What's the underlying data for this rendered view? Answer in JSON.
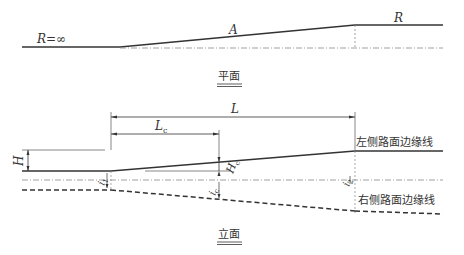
{
  "plan_view": {
    "caption": "平面",
    "label_left": "R=∞",
    "label_middle": "A",
    "label_right": "R"
  },
  "elevation_view": {
    "caption": "立面",
    "dim_L": "L",
    "dim_Lc": "L",
    "dim_Lc_sub": "c",
    "dim_H": "H",
    "dim_Hc": "H",
    "dim_Hc_sub": "c",
    "slope_i1": "i",
    "slope_i1_sub": "1",
    "slope_ic": "i",
    "slope_ic_sub": "c",
    "slope_i2": "i",
    "slope_i2_sub": "2",
    "left_edge_label": "左侧路面边缘线",
    "right_edge_label": "右侧路面边缘线"
  },
  "colors": {
    "line": "#333333",
    "dashed": "#555555",
    "centerline": "#888888"
  }
}
